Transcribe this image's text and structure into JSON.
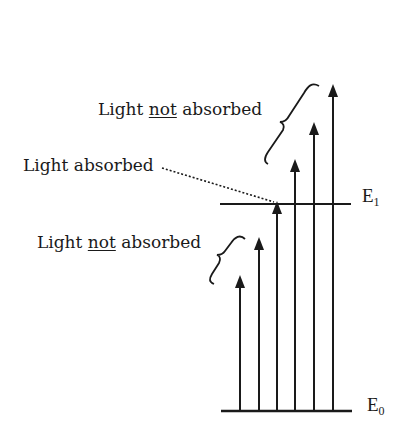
{
  "labels": {
    "not_absorbed_upper": {
      "pre": "Light ",
      "emph": "not",
      "post": " absorbed"
    },
    "absorbed": "Light absorbed",
    "not_absorbed_lower": {
      "pre": "Light ",
      "emph": "not",
      "post": " absorbed"
    }
  },
  "levels": [
    {
      "name": "E",
      "sub": "1"
    },
    {
      "name": "E",
      "sub": "0"
    }
  ],
  "colors": {
    "ink": "#1a1a1a",
    "background": "#ffffff"
  },
  "arrows": {
    "count": 6,
    "absorbed_index": 3,
    "lower_group": [
      1,
      2
    ],
    "upper_group": [
      4,
      5,
      6
    ]
  }
}
